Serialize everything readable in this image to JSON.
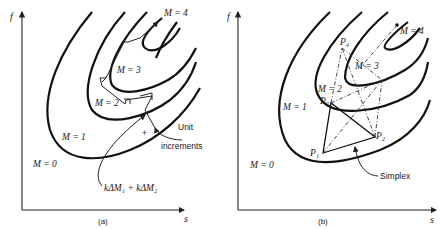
{
  "panel_a": {
    "caption": "(a)",
    "y_axis": "f",
    "x_axis": "s",
    "contours": [
      "M = 0",
      "M = 1",
      "M = 2",
      "M = 3",
      "M = 4"
    ],
    "annotations": {
      "unit_increments_line1": "Unit",
      "unit_increments_line2": "increments",
      "combined_step": "kΔM₁ + kΔM₂",
      "plus_sign": "+"
    }
  },
  "panel_b": {
    "caption": "(b)",
    "y_axis": "f",
    "x_axis": "s",
    "contours": [
      "M = 0",
      "M = 1",
      "M = 2",
      "M = 3",
      "M = 4"
    ],
    "points": [
      "P₁",
      "P₂",
      "P₃",
      "P₄"
    ],
    "annotations": {
      "simplex": "Simplex"
    }
  }
}
